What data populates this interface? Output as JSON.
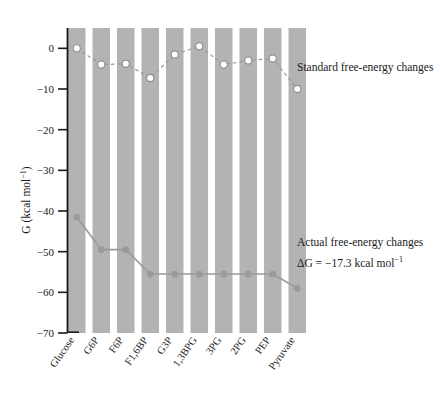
{
  "figure": {
    "y_axis_title": "G (kcal mol",
    "y_axis_title_sup": "−1",
    "y_axis_title_close": ")"
  },
  "annotations": {
    "standard_label": "Standard free-energy changes",
    "actual_label": "Actual free-energy changes",
    "actual_delta_g_prefix": "ΔG = ",
    "actual_delta_g_value": "−17.3 kcal mol",
    "actual_delta_g_sup": "−1"
  },
  "colors": {
    "band": "#b3b3b3",
    "axis": "#1a1a1a",
    "standard_line": "#9a9a9a",
    "standard_marker_fill": "#ffffff",
    "standard_marker_stroke": "#8c8c8c",
    "actual_line": "#9a9a9a",
    "actual_marker_fill": "#9a9a9a",
    "background": "#ffffff"
  },
  "chart_data": {
    "type": "line",
    "title": "",
    "xlabel": "",
    "ylabel": "G (kcal mol−1)",
    "ylim": [
      -70,
      5
    ],
    "yticks": [
      0,
      -10,
      -20,
      -30,
      -40,
      -50,
      -60,
      -70
    ],
    "ytick_labels": [
      "0",
      "−10",
      "−20",
      "−30",
      "−40",
      "−50",
      "−60",
      "−70"
    ],
    "grid": false,
    "legend_position": "right-inline-annotations",
    "categories": [
      "Glucose",
      "G6P",
      "F6P",
      "F1,6BP",
      "G3P",
      "1,3BPG",
      "3PG",
      "2PG",
      "PEP",
      "Pyruvate"
    ],
    "series": [
      {
        "name": "Standard free-energy changes",
        "style": "dashed",
        "marker": "open-circle",
        "values": [
          0,
          -4,
          -3.8,
          -7.3,
          -1.5,
          0.5,
          -4,
          -3,
          -2.5,
          -10
        ]
      },
      {
        "name": "Actual free-energy changes",
        "style": "solid",
        "marker": "filled-circle",
        "values": [
          -41.5,
          -49.5,
          -49.5,
          -55.5,
          -55.5,
          -55.5,
          -55.5,
          -55.5,
          -55.5,
          -59
        ]
      }
    ]
  }
}
